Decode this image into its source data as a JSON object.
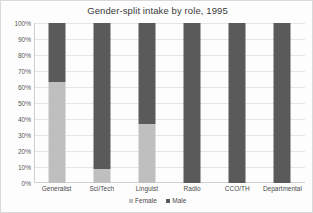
{
  "chart_data": {
    "type": "bar",
    "subtype": "stacked-percent-column",
    "title": "Gender-split intake by role, 1995",
    "xlabel": "",
    "ylabel": "",
    "ylim": [
      0,
      100
    ],
    "yticks": [
      "0%",
      "10%",
      "20%",
      "30%",
      "40%",
      "50%",
      "60%",
      "70%",
      "80%",
      "90%",
      "100%"
    ],
    "ytick_values": [
      0,
      10,
      20,
      30,
      40,
      50,
      60,
      70,
      80,
      90,
      100
    ],
    "grid": true,
    "legend_position": "bottom",
    "categories": [
      "Generalist",
      "Sci/Tech",
      "Linguist",
      "Radio",
      "CCO/TH",
      "Departmental"
    ],
    "series": [
      {
        "name": "Female",
        "color": "#bfbfbf",
        "values": [
          63,
          9,
          37,
          0,
          0,
          0
        ]
      },
      {
        "name": "Male",
        "color": "#5a5a5a",
        "values": [
          37,
          91,
          63,
          100,
          100,
          100
        ]
      }
    ]
  },
  "legend": {
    "items": [
      {
        "label": "Female",
        "swatch": "female"
      },
      {
        "label": "Male",
        "swatch": "male"
      }
    ]
  },
  "colors": {
    "female": "#bfbfbf",
    "male": "#5a5a5a",
    "gridline": "#e6e6e6",
    "axis": "#d0d0d0",
    "text": "#4a4a4a",
    "background": "#fdfdfd"
  }
}
